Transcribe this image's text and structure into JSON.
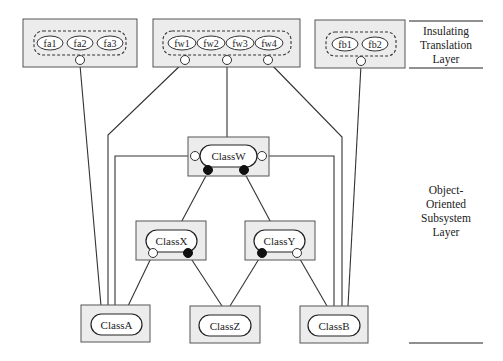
{
  "layers": [
    {
      "id": "insulating",
      "label": "Insulating\nTranslation\nLayer"
    },
    {
      "id": "oo",
      "label": "Object-\nOriented\nSubsystem\nLayer"
    }
  ],
  "translation_groups": [
    {
      "id": "fa",
      "functions": [
        "fa1",
        "fa2",
        "fa3"
      ]
    },
    {
      "id": "fw",
      "functions": [
        "fw1",
        "fw2",
        "fw3",
        "fw4"
      ]
    },
    {
      "id": "fb",
      "functions": [
        "fb1",
        "fb2"
      ]
    }
  ],
  "classes": {
    "classW": "ClassW",
    "classX": "ClassX",
    "classY": "ClassY",
    "classA": "ClassA",
    "classZ": "ClassZ",
    "classB": "ClassB"
  },
  "colors": {
    "box_fill": "#ececec",
    "box_stroke": "#555555",
    "line": "#333333",
    "port_open": "#ffffff",
    "port_filled": "#111111"
  }
}
